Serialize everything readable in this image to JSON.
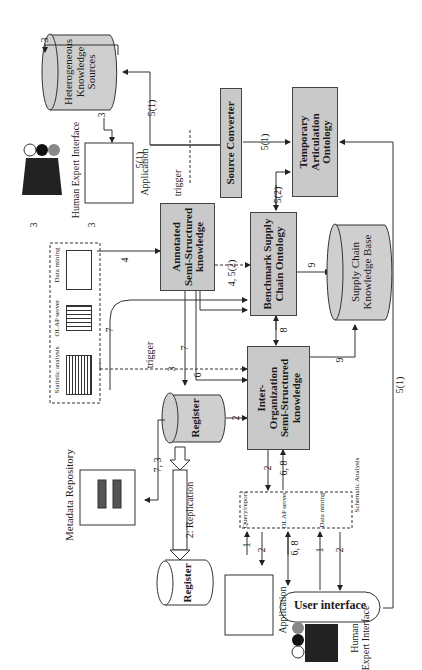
{
  "diagram": {
    "orientation": "rotated -90deg",
    "nodes": {
      "heterogeneous_sources": {
        "label_lines": [
          "Heterogeneous",
          "Knowledge",
          "Sources"
        ],
        "shape": "cylinder"
      },
      "source_converter": {
        "label": "Source Converter",
        "shape": "box"
      },
      "temporary_articulation": {
        "label_lines": [
          "Temporary",
          "Articulation",
          "Ontology"
        ],
        "shape": "box"
      },
      "annotated_ssk": {
        "label_lines": [
          "Annotated",
          "Semi-Structured",
          "knowledge"
        ],
        "shape": "box"
      },
      "benchmark_ontology": {
        "label_lines": [
          "Benchmark Supply",
          "Chain Ontology"
        ],
        "shape": "box"
      },
      "sc_knowledge_base": {
        "label_lines": [
          "Supply Chain",
          "Knowledge Base"
        ],
        "shape": "cylinder"
      },
      "inter_org_ssk": {
        "label_lines": [
          "Inter-",
          "Organization",
          "Semi-Structured",
          "knowledge"
        ],
        "shape": "box"
      },
      "register_main": {
        "label": "Register",
        "shape": "cylinder"
      },
      "register_replica": {
        "label": "Register",
        "shape": "stacked-cylinder"
      },
      "metadata_repository": {
        "label": "Metadata Repository",
        "shape": "stacked-cylinder"
      },
      "human_expert_top": {
        "label": "Human Expert Interface"
      },
      "application_top": {
        "label": "Application"
      },
      "analysis_tools_top": {
        "items": [
          "Statistic analysis",
          "OLAP server",
          "Data mining"
        ]
      },
      "analysis_tools_bottom": {
        "title": "Schematic Analysis",
        "items": [
          "Query/report",
          "OLAP server",
          "Data mining"
        ]
      },
      "user_interface": {
        "label": "User interface"
      },
      "human_expert_bottom": {
        "label_lines": [
          "Human",
          "Expert Interface"
        ]
      },
      "application_bottom": {
        "label": "Application"
      }
    },
    "edge_labels": {
      "e3a": "3",
      "e3b": "3",
      "e3c": "3",
      "e3d": "3",
      "e3e": "3",
      "e4": "4",
      "e4_52": "4, 5(2)",
      "e51_top": "5(1)",
      "e51_trigger": "5(1)",
      "e51_conv": "5(1)",
      "e51_right": "5(1)",
      "e52": "5(2)",
      "e7a": "7",
      "e7b": "7",
      "e73": "7, 3",
      "e6": "6",
      "e8": "8",
      "e9a": "9",
      "e9b": "9",
      "e2a": "2",
      "e2b": "2",
      "e2c": "2",
      "e2d": "2",
      "e68a": "6, 8",
      "e68b": "6, 8",
      "e1a": "1",
      "e1b": "1",
      "trigger_top": "trigger",
      "trigger_mid": "trigger",
      "replication": "2: Replication"
    }
  }
}
